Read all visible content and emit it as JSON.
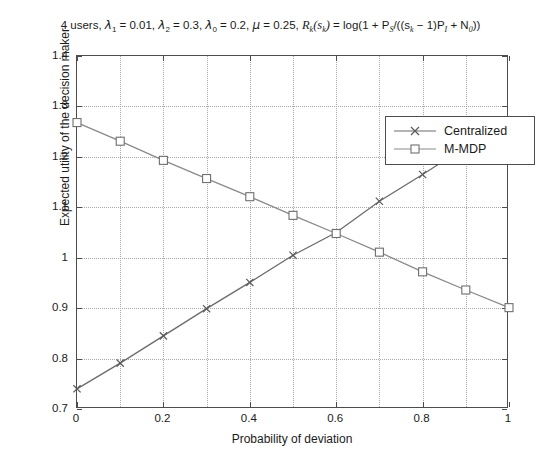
{
  "chart_data": {
    "type": "line",
    "title_parts": {
      "users": "4 users,",
      "lambda1": "= 0.01,",
      "lambda2": "= 0.3,",
      "lambda0": "= 0.2,",
      "mu": "= 0.25,",
      "rate_formula": "= log(1 + P",
      "formula_mid": "/((s",
      "formula_end": "− 1)P",
      "formula_tail": "+ N",
      "formula_close": "))"
    },
    "xlabel": "Probability of deviation",
    "ylabel": "Expected utility of the decision maker",
    "x": [
      0,
      0.1,
      0.2,
      0.3,
      0.4,
      0.5,
      0.6,
      0.7,
      0.8,
      0.9,
      1
    ],
    "xlim": [
      0,
      1
    ],
    "ylim": [
      0.7,
      1.4
    ],
    "xticks": [
      0,
      0.2,
      0.4,
      0.6,
      0.8,
      1
    ],
    "xtick_labels": [
      "0",
      "0.2",
      "0.4",
      "0.6",
      "0.8",
      "1"
    ],
    "xticks_minor": [
      0.1,
      0.3,
      0.5,
      0.7,
      0.9
    ],
    "yticks": [
      0.7,
      0.8,
      0.9,
      1.0,
      1.1,
      1.2,
      1.3,
      1.4
    ],
    "ytick_labels": [
      "0.7",
      "0.8",
      "0.9",
      "1",
      "1.1",
      "1.2",
      "1.3",
      "1.4"
    ],
    "grid": true,
    "legend_position": "top-right",
    "series": [
      {
        "name": "Centralized",
        "marker": "x",
        "color": "#6b6b6b",
        "values": [
          0.74,
          0.791,
          0.845,
          0.899,
          0.951,
          1.005,
          1.05,
          1.112,
          1.165,
          1.22,
          1.272
        ]
      },
      {
        "name": "M-MDP",
        "marker": "square",
        "color": "#8a8a8a",
        "values": [
          1.268,
          1.231,
          1.193,
          1.157,
          1.121,
          1.084,
          1.048,
          1.011,
          0.972,
          0.936,
          0.901
        ]
      }
    ]
  },
  "legend": {
    "items": [
      {
        "label": "Centralized"
      },
      {
        "label": "M-MDP"
      }
    ]
  }
}
